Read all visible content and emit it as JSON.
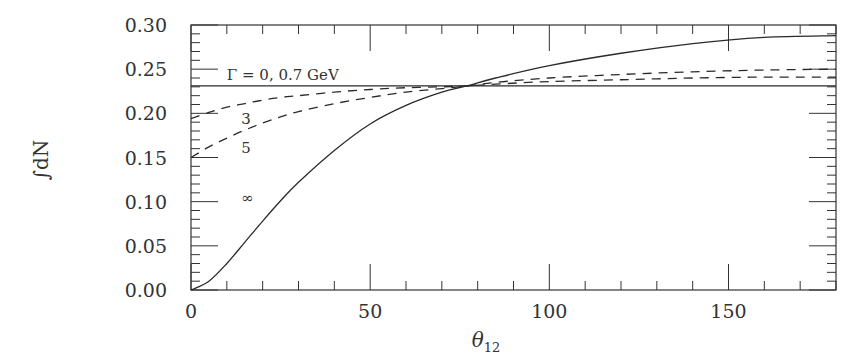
{
  "chart_data": {
    "type": "line",
    "title": "",
    "xlabel": "θ12",
    "xlabel_main": "θ",
    "xlabel_sub": "12",
    "ylabel": "∫dN",
    "xlim": [
      0,
      180
    ],
    "ylim": [
      0,
      0.3
    ],
    "grid": false,
    "legend": "none (inline annotations)",
    "x_ticks": [
      0,
      50,
      100,
      150
    ],
    "x_tick_labels": [
      "0",
      "50",
      "100",
      "150"
    ],
    "y_ticks": [
      0.0,
      0.05,
      0.1,
      0.15,
      0.2,
      0.25,
      0.3
    ],
    "y_tick_labels": [
      "0.00",
      "0.05",
      "0.10",
      "0.15",
      "0.20",
      "0.25",
      "0.30"
    ],
    "annotations": [
      {
        "text": "Γ = 0, 0.7 GeV",
        "x": 10,
        "y": 0.238
      },
      {
        "text": "3",
        "x": 14,
        "y": 0.188
      },
      {
        "text": "5",
        "x": 14,
        "y": 0.155
      },
      {
        "text": "∞",
        "x": 14,
        "y": 0.098
      }
    ],
    "x": [
      0,
      5,
      10,
      15,
      20,
      25,
      30,
      40,
      50,
      60,
      70,
      77,
      85,
      100,
      120,
      140,
      160,
      180
    ],
    "series": [
      {
        "name": "Γ = 0, 0.7 GeV",
        "style": "solid",
        "values": [
          0.231,
          0.231,
          0.231,
          0.231,
          0.231,
          0.231,
          0.231,
          0.231,
          0.231,
          0.231,
          0.231,
          0.231,
          0.231,
          0.231,
          0.231,
          0.231,
          0.231,
          0.231
        ]
      },
      {
        "name": "Γ = 3 GeV",
        "style": "dashed",
        "values": [
          0.194,
          0.201,
          0.207,
          0.211,
          0.215,
          0.218,
          0.22,
          0.224,
          0.227,
          0.229,
          0.23,
          0.231,
          0.233,
          0.236,
          0.238,
          0.24,
          0.241,
          0.241
        ]
      },
      {
        "name": "Γ = 5 GeV",
        "style": "dashed",
        "values": [
          0.15,
          0.162,
          0.172,
          0.181,
          0.189,
          0.196,
          0.202,
          0.211,
          0.218,
          0.224,
          0.228,
          0.231,
          0.235,
          0.24,
          0.244,
          0.247,
          0.249,
          0.25
        ]
      },
      {
        "name": "Γ = ∞",
        "style": "solid",
        "values": [
          0.0,
          0.01,
          0.03,
          0.054,
          0.078,
          0.101,
          0.122,
          0.158,
          0.188,
          0.209,
          0.224,
          0.231,
          0.24,
          0.254,
          0.268,
          0.279,
          0.286,
          0.288
        ]
      }
    ]
  },
  "colors": {
    "line": "#2a2a2a",
    "frame": "#333333",
    "background": "#ffffff"
  }
}
